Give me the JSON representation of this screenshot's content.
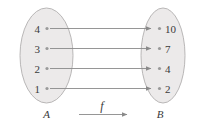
{
  "diagram": {
    "type": "function-mapping-diagram",
    "background_color": "#ffffff",
    "ellipse_fill": "#eceaea",
    "ellipse_stroke": "#b9b7b7",
    "arrow_color": "#8a8a8a",
    "dot_color": "#9a9a9a",
    "text_color": "#3a3a3a",
    "domain": {
      "label": "A",
      "name": "set-a",
      "elements": [
        {
          "value": "4"
        },
        {
          "value": "3"
        },
        {
          "value": "2"
        },
        {
          "value": "1"
        }
      ]
    },
    "codomain": {
      "label": "B",
      "name": "set-b",
      "elements": [
        {
          "value": "10"
        },
        {
          "value": "7"
        },
        {
          "value": "4"
        },
        {
          "value": "2"
        }
      ]
    },
    "function": {
      "label": "f",
      "mappings": [
        {
          "from": "4",
          "to": "10"
        },
        {
          "from": "3",
          "to": "7"
        },
        {
          "from": "2",
          "to": "4"
        },
        {
          "from": "1",
          "to": "2"
        }
      ]
    }
  }
}
